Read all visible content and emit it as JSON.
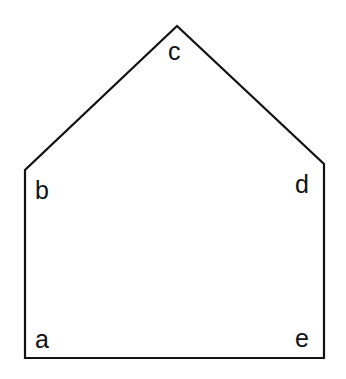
{
  "diagram": {
    "shape": "pentagon",
    "stroke_color": "#111111",
    "background": "#ffffff",
    "vertices": [
      {
        "label": "a",
        "x": 25,
        "y": 358
      },
      {
        "label": "b",
        "x": 25,
        "y": 170
      },
      {
        "label": "c",
        "x": 177,
        "y": 26
      },
      {
        "label": "d",
        "x": 324,
        "y": 164
      },
      {
        "label": "e",
        "x": 324,
        "y": 358
      }
    ],
    "labels": {
      "a": "a",
      "b": "b",
      "c": "c",
      "d": "d",
      "e": "e"
    }
  }
}
